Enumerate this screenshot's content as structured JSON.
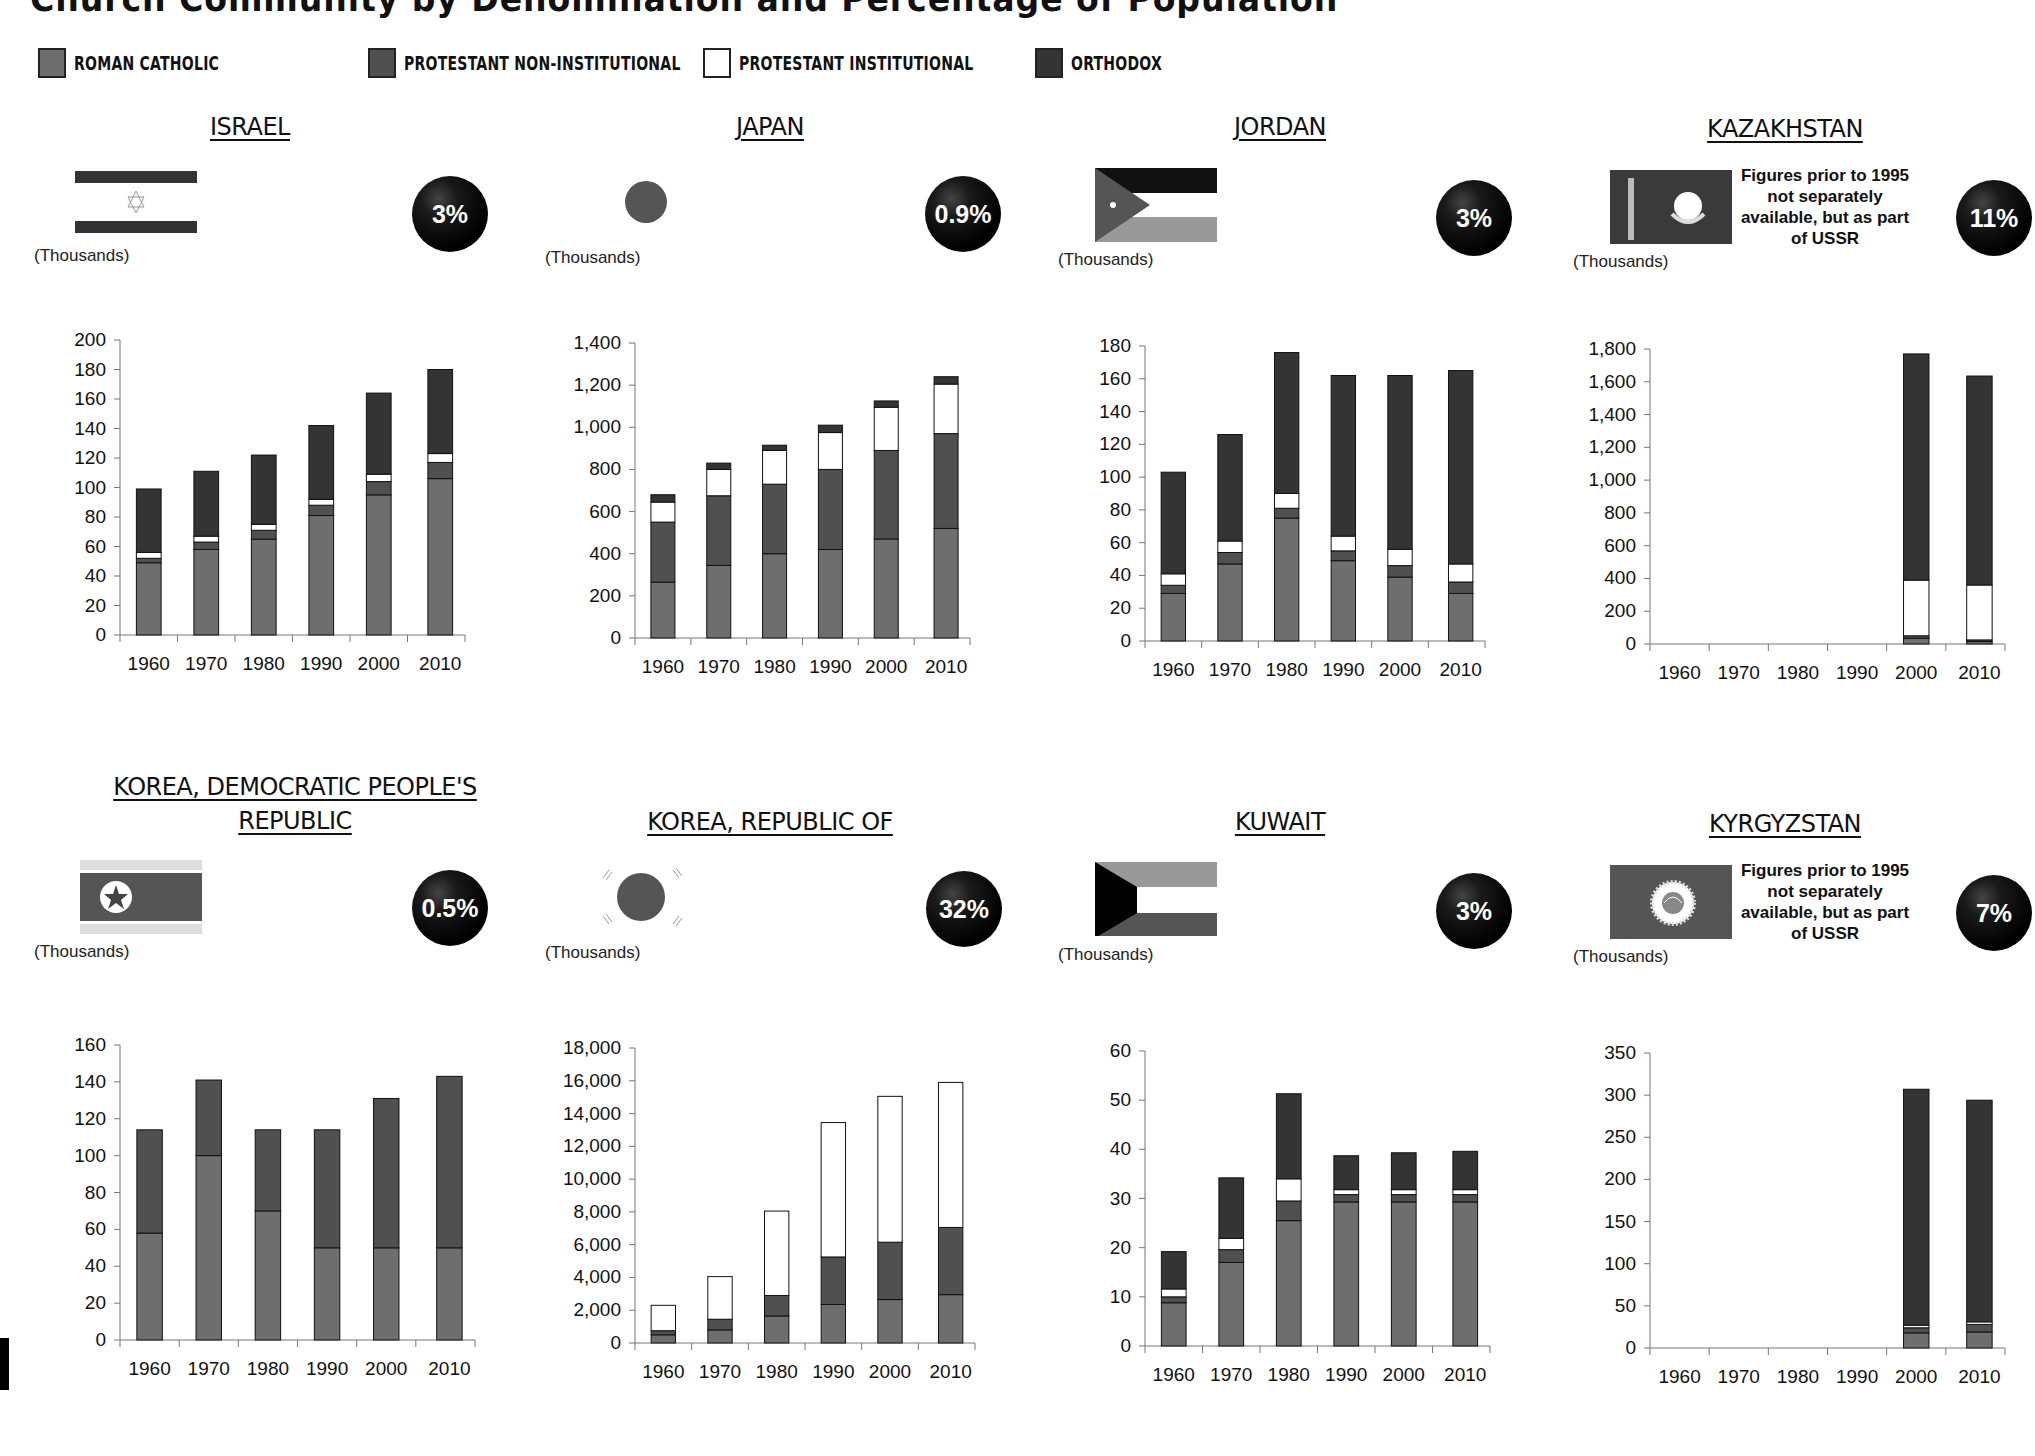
{
  "page": {
    "title": "Church Community by Denomination and Percentage of Population",
    "unit_label": "(Thousands)"
  },
  "legend": [
    {
      "key": "rc",
      "label": "ROMAN CATHOLIC",
      "color": "#6e6e6e"
    },
    {
      "key": "pni",
      "label": "PROTESTANT NON-INSTITUTIONAL",
      "color": "#505050"
    },
    {
      "key": "pi",
      "label": "PROTESTANT INSTITUTIONAL",
      "color": "#ffffff"
    },
    {
      "key": "or",
      "label": "ORTHODOX",
      "color": "#343434"
    }
  ],
  "countries": [
    {
      "name": "ISRAEL",
      "percent": "3%",
      "note": "",
      "flag": "israel"
    },
    {
      "name": "JAPAN",
      "percent": "0.9%",
      "note": "",
      "flag": "japan"
    },
    {
      "name": "JORDAN",
      "percent": "3%",
      "note": "",
      "flag": "jordan"
    },
    {
      "name": "KAZAKHSTAN",
      "percent": "11%",
      "note": "Figures prior to 1995 not separately available, but as part of USSR",
      "flag": "kazakhstan"
    },
    {
      "name": "KOREA, DEMOCRATIC PEOPLE'S REPUBLIC",
      "percent": "0.5%",
      "note": "",
      "flag": "north-korea"
    },
    {
      "name": "KOREA, REPUBLIC OF",
      "percent": "32%",
      "note": "",
      "flag": "south-korea"
    },
    {
      "name": "KUWAIT",
      "percent": "3%",
      "note": "",
      "flag": "kuwait"
    },
    {
      "name": "KYRGYZSTAN",
      "percent": "7%",
      "note": "Figures prior to 1995 not separately available, but as part of USSR",
      "flag": "kyrgyzstan"
    }
  ],
  "chart_data": [
    {
      "type": "bar",
      "stacked": true,
      "title": "ISRAEL",
      "ylabel": "(Thousands)",
      "xlabel": "",
      "categories": [
        "1960",
        "1970",
        "1980",
        "1990",
        "2000",
        "2010"
      ],
      "ylim": [
        0,
        200
      ],
      "yticks": [
        0,
        20,
        40,
        60,
        80,
        100,
        120,
        140,
        160,
        180,
        200
      ],
      "ytick_labels": [
        "0",
        "20",
        "40",
        "60",
        "80",
        "100",
        "120",
        "140",
        "160",
        "180",
        "200"
      ],
      "series": [
        {
          "name": "Roman Catholic",
          "values": [
            49,
            58,
            65,
            81,
            95,
            106
          ]
        },
        {
          "name": "Protestant Non-Institutional",
          "values": [
            3,
            5,
            6,
            7,
            9,
            11
          ]
        },
        {
          "name": "Protestant Institutional",
          "values": [
            4,
            4,
            4,
            4,
            5,
            6
          ]
        },
        {
          "name": "Orthodox",
          "values": [
            43,
            44,
            47,
            50,
            55,
            57
          ]
        }
      ],
      "annotation": "3%"
    },
    {
      "type": "bar",
      "stacked": true,
      "title": "JAPAN",
      "ylabel": "(Thousands)",
      "xlabel": "",
      "categories": [
        "1960",
        "1970",
        "1980",
        "1990",
        "2000",
        "2010"
      ],
      "ylim": [
        0,
        1400
      ],
      "yticks": [
        0,
        200,
        400,
        600,
        800,
        1000,
        1200,
        1400
      ],
      "ytick_labels": [
        "0",
        "200",
        "400",
        "600",
        "800",
        "1,000",
        "1,200",
        "1,400"
      ],
      "series": [
        {
          "name": "Roman Catholic",
          "values": [
            265,
            345,
            400,
            420,
            470,
            520
          ]
        },
        {
          "name": "Protestant Non-Institutional",
          "values": [
            285,
            330,
            330,
            380,
            420,
            450
          ]
        },
        {
          "name": "Protestant Institutional",
          "values": [
            95,
            125,
            160,
            175,
            205,
            235
          ]
        },
        {
          "name": "Orthodox",
          "values": [
            35,
            30,
            25,
            35,
            30,
            35
          ]
        }
      ],
      "annotation": "0.9%"
    },
    {
      "type": "bar",
      "stacked": true,
      "title": "JORDAN",
      "ylabel": "(Thousands)",
      "xlabel": "",
      "categories": [
        "1960",
        "1970",
        "1980",
        "1990",
        "2000",
        "2010"
      ],
      "ylim": [
        0,
        180
      ],
      "yticks": [
        0,
        20,
        40,
        60,
        80,
        100,
        120,
        140,
        160,
        180
      ],
      "ytick_labels": [
        "0",
        "20",
        "40",
        "60",
        "80",
        "100",
        "120",
        "140",
        "160",
        "180"
      ],
      "series": [
        {
          "name": "Roman Catholic",
          "values": [
            29,
            47,
            75,
            49,
            39,
            29
          ]
        },
        {
          "name": "Protestant Non-Institutional",
          "values": [
            5,
            7,
            6,
            6,
            7,
            7
          ]
        },
        {
          "name": "Protestant Institutional",
          "values": [
            7,
            7,
            9,
            9,
            10,
            11
          ]
        },
        {
          "name": "Orthodox",
          "values": [
            62,
            65,
            86,
            98,
            106,
            118
          ]
        }
      ],
      "annotation": "3%"
    },
    {
      "type": "bar",
      "stacked": true,
      "title": "KAZAKHSTAN",
      "ylabel": "(Thousands)",
      "xlabel": "",
      "categories": [
        "1960",
        "1970",
        "1980",
        "1990",
        "2000",
        "2010"
      ],
      "ylim": [
        0,
        1800
      ],
      "yticks": [
        0,
        200,
        400,
        600,
        800,
        1000,
        1200,
        1400,
        1600,
        1800
      ],
      "ytick_labels": [
        "0",
        "200",
        "400",
        "600",
        "800",
        "1,000",
        "1,200",
        "1,400",
        "1,600",
        "1,800"
      ],
      "series": [
        {
          "name": "Roman Catholic",
          "values": [
            null,
            null,
            null,
            null,
            35,
            15
          ]
        },
        {
          "name": "Protestant Non-Institutional",
          "values": [
            null,
            null,
            null,
            null,
            15,
            10
          ]
        },
        {
          "name": "Protestant Institutional",
          "values": [
            null,
            null,
            null,
            null,
            340,
            335
          ]
        },
        {
          "name": "Orthodox",
          "values": [
            null,
            null,
            null,
            null,
            1380,
            1275
          ]
        }
      ],
      "annotation": "11%"
    },
    {
      "type": "bar",
      "stacked": true,
      "title": "KOREA, DEMOCRATIC PEOPLE'S REPUBLIC",
      "ylabel": "(Thousands)",
      "xlabel": "",
      "categories": [
        "1960",
        "1970",
        "1980",
        "1990",
        "2000",
        "2010"
      ],
      "ylim": [
        0,
        160
      ],
      "yticks": [
        0,
        20,
        40,
        60,
        80,
        100,
        120,
        140,
        160
      ],
      "ytick_labels": [
        "0",
        "20",
        "40",
        "60",
        "80",
        "100",
        "120",
        "140",
        "160"
      ],
      "series": [
        {
          "name": "Roman Catholic",
          "values": [
            58,
            100,
            70,
            50,
            50,
            50
          ]
        },
        {
          "name": "Protestant Non-Institutional",
          "values": [
            56,
            41,
            44,
            64,
            81,
            93
          ]
        },
        {
          "name": "Protestant Institutional",
          "values": [
            0,
            0,
            0,
            0,
            0,
            0
          ]
        },
        {
          "name": "Orthodox",
          "values": [
            0,
            0,
            0,
            0,
            0,
            0
          ]
        }
      ],
      "annotation": "0.5%"
    },
    {
      "type": "bar",
      "stacked": true,
      "title": "KOREA, REPUBLIC OF",
      "ylabel": "(Thousands)",
      "xlabel": "",
      "categories": [
        "1960",
        "1970",
        "1980",
        "1990",
        "2000",
        "2010"
      ],
      "ylim": [
        0,
        18000
      ],
      "yticks": [
        0,
        2000,
        4000,
        6000,
        8000,
        10000,
        12000,
        14000,
        16000,
        18000
      ],
      "ytick_labels": [
        "0",
        "2,000",
        "4,000",
        "6,000",
        "8,000",
        "10,000",
        "12,000",
        "14,000",
        "16,000",
        "18,000"
      ],
      "series": [
        {
          "name": "Roman Catholic",
          "values": [
            500,
            800,
            1650,
            2350,
            2650,
            2950
          ]
        },
        {
          "name": "Protestant Non-Institutional",
          "values": [
            250,
            650,
            1250,
            2900,
            3500,
            4100
          ]
        },
        {
          "name": "Protestant Institutional",
          "values": [
            1550,
            2600,
            5150,
            8200,
            8900,
            8850
          ]
        },
        {
          "name": "Orthodox",
          "values": [
            0,
            0,
            0,
            0,
            0,
            0
          ]
        }
      ],
      "annotation": "32%"
    },
    {
      "type": "bar",
      "stacked": true,
      "title": "KUWAIT",
      "ylabel": "(Thousands)",
      "xlabel": "",
      "categories": [
        "1960",
        "1970",
        "1980",
        "1990",
        "2000",
        "2010"
      ],
      "ylim": [
        0,
        60
      ],
      "yticks": [
        0,
        10,
        20,
        30,
        40,
        50,
        60
      ],
      "ytick_labels": [
        "0",
        "10",
        "20",
        "30",
        "40",
        "50",
        "60"
      ],
      "series": [
        {
          "name": "Roman Catholic",
          "values": [
            8.8,
            17,
            25.5,
            29.3,
            29.3,
            29.3
          ]
        },
        {
          "name": "Protestant Non-Institutional",
          "values": [
            1.2,
            2.6,
            4,
            1.5,
            1.5,
            1.5
          ]
        },
        {
          "name": "Protestant Institutional",
          "values": [
            1.6,
            2.3,
            4.5,
            1,
            1,
            1
          ]
        },
        {
          "name": "Orthodox",
          "values": [
            7.6,
            12.3,
            17.3,
            6.9,
            7.5,
            7.8
          ]
        }
      ],
      "annotation": "3%"
    },
    {
      "type": "bar",
      "stacked": true,
      "title": "KYRGYZSTAN",
      "ylabel": "(Thousands)",
      "xlabel": "",
      "categories": [
        "1960",
        "1970",
        "1980",
        "1990",
        "2000",
        "2010"
      ],
      "ylim": [
        0,
        350
      ],
      "yticks": [
        0,
        50,
        100,
        150,
        200,
        250,
        300,
        350
      ],
      "ytick_labels": [
        "0",
        "50",
        "100",
        "150",
        "200",
        "250",
        "300",
        "350"
      ],
      "series": [
        {
          "name": "Roman Catholic",
          "values": [
            null,
            null,
            null,
            null,
            18,
            19
          ]
        },
        {
          "name": "Protestant Non-Institutional",
          "values": [
            null,
            null,
            null,
            null,
            6,
            9
          ]
        },
        {
          "name": "Protestant Institutional",
          "values": [
            null,
            null,
            null,
            null,
            3,
            3
          ]
        },
        {
          "name": "Orthodox",
          "values": [
            null,
            null,
            null,
            null,
            280,
            263
          ]
        }
      ],
      "annotation": "7%"
    }
  ]
}
